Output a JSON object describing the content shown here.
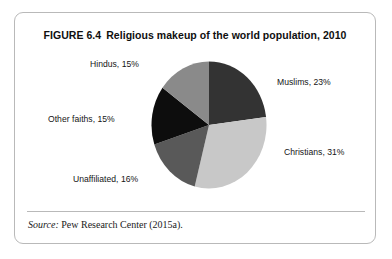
{
  "figure": {
    "number": "FIGURE 6.4",
    "title": "Religious makeup of the world population, 2010",
    "source_word": "Source:",
    "source_text": "Pew Research Center (2015a)."
  },
  "chart_data": {
    "type": "pie",
    "title": "Religious makeup of the world population, 2010",
    "categories": [
      "Muslims",
      "Christians",
      "Unaffiliated",
      "Other faiths",
      "Hindus"
    ],
    "values": [
      23,
      31,
      16,
      15,
      15
    ],
    "unit": "%",
    "start_angle_deg": 0,
    "direction": "clockwise",
    "legend": "none",
    "grid": false,
    "labels": [
      {
        "key": "muslims",
        "text": "Muslims, 23%",
        "value": 23,
        "color": "#333333"
      },
      {
        "key": "christians",
        "text": "Christians, 31%",
        "value": 31,
        "color": "#c8c8c8"
      },
      {
        "key": "unaffiliated",
        "text": "Unaffiliated, 16%",
        "value": 16,
        "color": "#595959"
      },
      {
        "key": "other",
        "text": "Other faiths, 15%",
        "value": 15,
        "color": "#0d0d0d"
      },
      {
        "key": "hindus",
        "text": "Hindus, 15%",
        "value": 15,
        "color": "#8a8a8a"
      }
    ],
    "slice_colors": {
      "muslims": "#333333",
      "christians": "#c8c8c8",
      "unaffiliated": "#595959",
      "other_faiths": "#0d0d0d",
      "hindus": "#8a8a8a"
    }
  },
  "colors": {
    "card_border": "#b9b9b9",
    "text": "#151515",
    "background": "#ffffff"
  }
}
